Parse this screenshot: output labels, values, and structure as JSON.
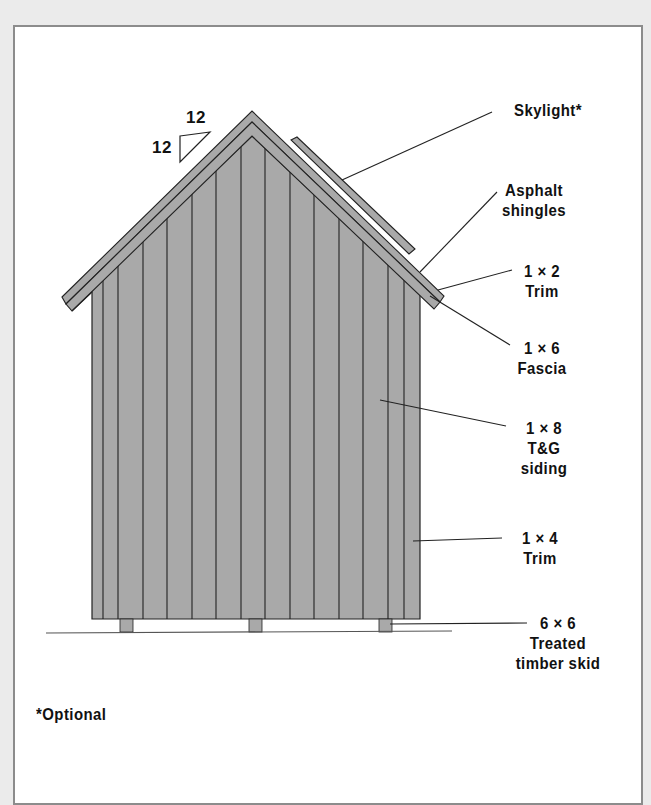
{
  "figure": {
    "pitch": {
      "rise": "12",
      "run": "12"
    },
    "callouts": [
      {
        "id": "skylight",
        "lines": [
          "Skylight*"
        ]
      },
      {
        "id": "asphalt-shingles",
        "lines": [
          "Asphalt",
          "shingles"
        ]
      },
      {
        "id": "trim-1x2",
        "lines": [
          "1 × 2",
          "Trim"
        ]
      },
      {
        "id": "fascia-1x6",
        "lines": [
          "1 × 6",
          "Fascia"
        ]
      },
      {
        "id": "siding-1x8",
        "lines": [
          "1 × 8",
          "T&G",
          "siding"
        ]
      },
      {
        "id": "trim-1x4",
        "lines": [
          "1 × 4",
          "Trim"
        ]
      },
      {
        "id": "skid-6x6",
        "lines": [
          "6 × 6",
          "Treated",
          "timber skid"
        ]
      }
    ],
    "footnote": "*Optional"
  },
  "colors": {
    "background": "#ebebeb",
    "panel": "#ffffff",
    "frame_border": "#8c8c8c",
    "siding_fill": "#a9a9a9",
    "outline": "#222222",
    "text": "#111111"
  }
}
